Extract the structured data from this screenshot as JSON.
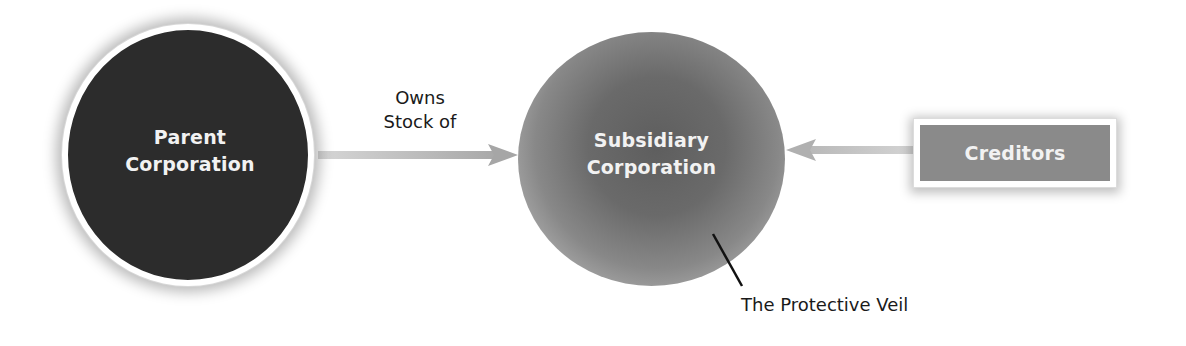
{
  "diagram": {
    "parent": {
      "line1": "Parent",
      "line2": "Corporation",
      "fill": "#2c2c2c"
    },
    "relationship": {
      "line1": "Owns",
      "line2": "Stock of"
    },
    "subsidiary": {
      "line1": "Subsidiary",
      "line2": "Corporation",
      "fill": "#6a6a6a"
    },
    "creditors": {
      "label": "Creditors",
      "fill": "#8a8a8a"
    },
    "veil": {
      "label": "The Protective Veil"
    },
    "arrows": [
      {
        "from": "Parent Corporation",
        "to": "Subsidiary Corporation",
        "label": "Owns Stock of"
      },
      {
        "from": "Creditors",
        "to": "Subsidiary Corporation",
        "label": ""
      }
    ],
    "arrow_color": "#b5b5b5"
  }
}
